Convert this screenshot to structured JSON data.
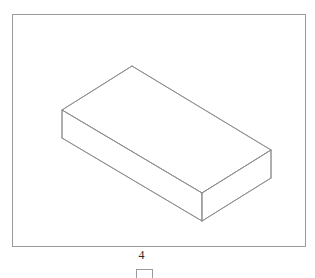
{
  "page": {
    "background_color": "#ffffff",
    "width": 315,
    "height": 276
  },
  "figure": {
    "frame": {
      "name": "figure-border",
      "stroke_color": "#9a9a9a",
      "stroke_width": 1,
      "x": 12,
      "y": 14,
      "width": 294,
      "height": 233
    },
    "drawing": {
      "type": "isometric-solid",
      "shape": "rectangular-box",
      "stroke_color": "#8c8c8c",
      "stroke_width": 0.9,
      "fill_color": "#ffffff",
      "vertices": {
        "top_apex": [
          132,
          66
        ],
        "top_left": [
          62,
          110
        ],
        "top_right": [
          271,
          150
        ],
        "top_front": [
          202,
          193
        ],
        "bottom_left": [
          62,
          138
        ],
        "bottom_front": [
          202,
          221
        ],
        "bottom_right": [
          271,
          178
        ]
      },
      "faces": [
        {
          "name": "top-face",
          "points": "132,66 62,110 202,193 271,150"
        },
        {
          "name": "left-front-face",
          "points": "62,110 62,138 202,221 202,193"
        },
        {
          "name": "right-front-face",
          "points": "202,193 202,221 271,178 271,150"
        }
      ]
    }
  },
  "annotations": {
    "dimension_label": "4",
    "dimension_label_color": "#2b2b2b"
  },
  "cut_element": {
    "name": "cropped-rectangle",
    "stroke_color": "#9a9a9a",
    "x": 136,
    "y": 269,
    "width": 17,
    "height": 9
  }
}
